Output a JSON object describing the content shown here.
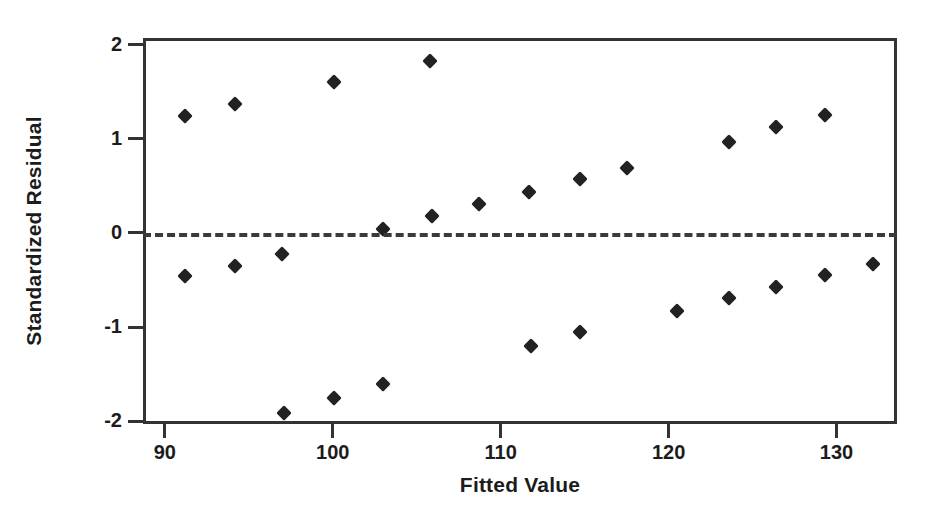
{
  "chart_data": {
    "type": "scatter",
    "title": "",
    "xlabel": "Fitted Value",
    "ylabel": "Standardized Residual",
    "xlim": [
      88.7,
      133.6
    ],
    "ylim": [
      -2.03,
      2.07
    ],
    "xticks": [
      90,
      100,
      110,
      120,
      130
    ],
    "yticks": [
      2,
      1,
      0,
      -1,
      -2
    ],
    "xtick_labels": [
      "90",
      "100",
      "110",
      "120",
      "130"
    ],
    "ytick_labels": [
      "2",
      "1",
      "0",
      "-1",
      "-2"
    ],
    "grid": false,
    "legend": null,
    "reference_lines": [
      {
        "name": "zero-reference",
        "orientation": "horizontal",
        "y": 0,
        "style": "dashed",
        "color": "#3a3a3a"
      }
    ],
    "marker": {
      "shape": "diamond",
      "color": "#222222",
      "size": 11
    },
    "points": [
      {
        "x": 91.2,
        "y": 1.24
      },
      {
        "x": 94.2,
        "y": 1.37
      },
      {
        "x": 100.1,
        "y": 1.6
      },
      {
        "x": 105.8,
        "y": 1.83
      },
      {
        "x": 103.0,
        "y": 0.04
      },
      {
        "x": 105.9,
        "y": 0.18
      },
      {
        "x": 108.7,
        "y": 0.31
      },
      {
        "x": 111.7,
        "y": 0.43
      },
      {
        "x": 114.7,
        "y": 0.57
      },
      {
        "x": 117.5,
        "y": 0.69
      },
      {
        "x": 123.6,
        "y": 0.97
      },
      {
        "x": 126.4,
        "y": 1.12
      },
      {
        "x": 129.3,
        "y": 1.25
      },
      {
        "x": 91.2,
        "y": -0.46
      },
      {
        "x": 94.2,
        "y": -0.35
      },
      {
        "x": 97.0,
        "y": -0.22
      },
      {
        "x": 97.1,
        "y": -1.91
      },
      {
        "x": 100.1,
        "y": -1.75
      },
      {
        "x": 103.0,
        "y": -1.6
      },
      {
        "x": 111.8,
        "y": -1.2
      },
      {
        "x": 114.7,
        "y": -1.05
      },
      {
        "x": 120.5,
        "y": -0.83
      },
      {
        "x": 123.6,
        "y": -0.69
      },
      {
        "x": 126.4,
        "y": -0.58
      },
      {
        "x": 129.3,
        "y": -0.45
      },
      {
        "x": 132.2,
        "y": -0.33
      }
    ]
  },
  "figure": {
    "background_color": "#ffffff",
    "axis_color": "#333333",
    "text_color": "#1c1c1c"
  }
}
